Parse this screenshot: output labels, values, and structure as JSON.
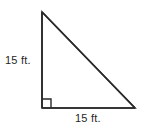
{
  "figure": {
    "type": "right-triangle",
    "background_color": "#ffffff",
    "stroke_color": "#2a2a2a",
    "stroke_width": 1.6,
    "vertices": {
      "apex": {
        "x": 42,
        "y": 12
      },
      "right_angle": {
        "x": 42,
        "y": 108
      },
      "bottom_right": {
        "x": 135,
        "y": 108
      }
    },
    "right_angle_marker": {
      "present": true,
      "size": 9,
      "x": 42,
      "y": 99
    },
    "labels": {
      "vertical_leg": "15 ft.",
      "horizontal_leg": "15 ft."
    }
  }
}
